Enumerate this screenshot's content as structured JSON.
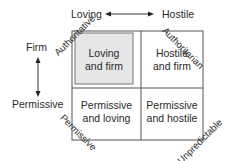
{
  "diagram": {
    "type": "2x2 parenting-style matrix",
    "axes": {
      "horizontal": {
        "left": "Loving",
        "right": "Hostile"
      },
      "vertical": {
        "top": "Firm",
        "bottom": "Permissive"
      }
    },
    "cells": [
      {
        "position": "top-left",
        "line1": "Loving",
        "line2": "and firm",
        "highlighted": true
      },
      {
        "position": "top-right",
        "line1": "Hostile",
        "line2": "and firm",
        "highlighted": false
      },
      {
        "position": "bottom-left",
        "line1": "Permissive",
        "line2": "and loving",
        "highlighted": false
      },
      {
        "position": "bottom-right",
        "line1": "Permissive",
        "line2": "and hostile",
        "highlighted": false
      }
    ],
    "diagonal_labels": {
      "top_left": "Authoritative",
      "top_right": "Authoritarian",
      "bottom_left": "Permissive",
      "bottom_right": "Unpredictable"
    },
    "colors": {
      "line": "#555555",
      "highlight_fill": "#e6e6e6",
      "text": "#2a2a2a"
    }
  }
}
